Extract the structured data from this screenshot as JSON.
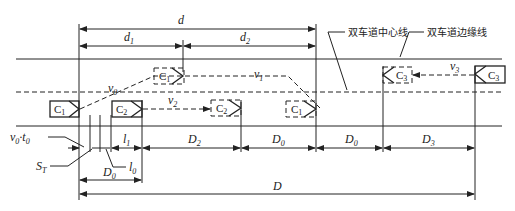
{
  "diagram": {
    "dimensions": {
      "d": "d",
      "d1": {
        "base": "d",
        "sub": "1"
      },
      "d2": {
        "base": "d",
        "sub": "2"
      },
      "l1": {
        "base": "l",
        "sub": "1"
      },
      "l0": {
        "base": "l",
        "sub": "0"
      },
      "D2": {
        "base": "D",
        "sub": "2"
      },
      "D0a": {
        "base": "D",
        "sub": "0"
      },
      "D0b": {
        "base": "D",
        "sub": "0"
      },
      "D0c": {
        "base": "D",
        "sub": "0"
      },
      "D3": {
        "base": "D",
        "sub": "3"
      },
      "D": "D",
      "v0t0": {
        "v": "v",
        "vsub": "0",
        "dot": "·",
        "t": "t",
        "tsub": "0"
      },
      "ST": {
        "base": "S",
        "sub": "T"
      }
    },
    "velocities": {
      "v0": {
        "base": "v",
        "sub": "0"
      },
      "v1": {
        "base": "v",
        "sub": "1"
      },
      "v2": {
        "base": "v",
        "sub": "2"
      },
      "v3": {
        "base": "v",
        "sub": "3"
      }
    },
    "cars": {
      "c1_start": {
        "base": "C",
        "sub": "1"
      },
      "c1_mid": {
        "base": "C",
        "sub": "1"
      },
      "c1_end": {
        "base": "C",
        "sub": "1"
      },
      "c2_start": {
        "base": "C",
        "sub": "2"
      },
      "c2_end": {
        "base": "C",
        "sub": "2"
      },
      "c3_start": {
        "base": "C",
        "sub": "3"
      },
      "c3_end": {
        "base": "C",
        "sub": "3"
      }
    },
    "annotations": {
      "centerline": "双车道中心线",
      "edgeline": "双车道边缘线"
    }
  }
}
